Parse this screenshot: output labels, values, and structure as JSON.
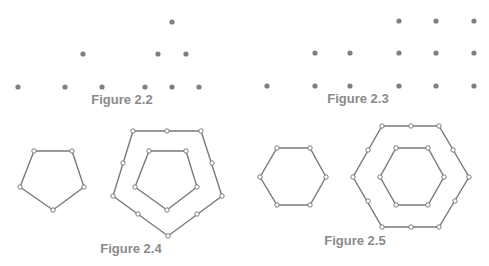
{
  "colors": {
    "dot": "#7f7f7f",
    "line": "#7a7a7a",
    "vertex_fill": "#ffffff",
    "vertex_stroke": "#6e6e6e",
    "label": "#8a8a8a"
  },
  "figures": [
    {
      "id": "fig-2-2",
      "label": "Figure 2.2",
      "label_pos": [
        122,
        93
      ],
      "description": "Triangular numbers as dot arrays: 1, 3, 6",
      "dots": [
        [
          18,
          87
        ],
        [
          83,
          54
        ],
        [
          65,
          87
        ],
        [
          102,
          87
        ],
        [
          172,
          22
        ],
        [
          158,
          54
        ],
        [
          186,
          54
        ],
        [
          145,
          87
        ],
        [
          172,
          87
        ],
        [
          199,
          87
        ]
      ]
    },
    {
      "id": "fig-2-3",
      "label": "Figure 2.3",
      "label_pos": [
        358,
        92
      ],
      "description": "Square numbers as dot arrays: 1, 4, 9",
      "dots": [
        [
          267,
          86
        ],
        [
          315,
          53
        ],
        [
          350,
          53
        ],
        [
          315,
          86
        ],
        [
          350,
          86
        ],
        [
          399,
          21
        ],
        [
          436,
          21
        ],
        [
          474,
          21
        ],
        [
          399,
          53
        ],
        [
          436,
          53
        ],
        [
          474,
          53
        ],
        [
          399,
          86
        ],
        [
          436,
          86
        ],
        [
          474,
          86
        ]
      ]
    },
    {
      "id": "fig-2-4",
      "label": "Figure 2.4",
      "label_pos": [
        131,
        242
      ],
      "description": "Pentagonal numbers: nested pentagons",
      "polygons": [
        {
          "name": "small-pentagon",
          "points": [
            [
              34,
              151
            ],
            [
              72,
              151
            ],
            [
              84,
              187
            ],
            [
              53,
              210
            ],
            [
              20,
              187
            ]
          ],
          "vertices": [
            [
              34,
              151
            ],
            [
              72,
              151
            ],
            [
              84,
              187
            ],
            [
              53,
              210
            ],
            [
              20,
              187
            ]
          ]
        },
        {
          "name": "outer-pentagon",
          "points": [
            [
              133,
              131
            ],
            [
              201,
              131
            ],
            [
              222,
              196
            ],
            [
              168,
              236
            ],
            [
              113,
              196
            ]
          ],
          "vertices": [
            [
              133,
              131
            ],
            [
              167,
              131
            ],
            [
              201,
              131
            ],
            [
              212,
              163
            ],
            [
              222,
              196
            ],
            [
              197,
              214
            ],
            [
              168,
              236
            ],
            [
              138,
              214
            ],
            [
              113,
              196
            ],
            [
              123,
              163
            ]
          ]
        },
        {
          "name": "inner-pentagon",
          "points": [
            [
              149,
              151
            ],
            [
              186,
              151
            ],
            [
              197,
              187
            ],
            [
              167,
              210
            ],
            [
              135,
              187
            ]
          ],
          "vertices": [
            [
              149,
              151
            ],
            [
              186,
              151
            ],
            [
              197,
              187
            ],
            [
              167,
              210
            ],
            [
              135,
              187
            ]
          ]
        }
      ]
    },
    {
      "id": "fig-2-5",
      "label": "Figure 2.5",
      "label_pos": [
        355,
        234
      ],
      "description": "Hexagonal numbers: nested hexagons",
      "polygons": [
        {
          "name": "small-hexagon",
          "points": [
            [
              277,
              148
            ],
            [
              310,
              148
            ],
            [
              326,
              177
            ],
            [
              310,
              205
            ],
            [
              277,
              205
            ],
            [
              260,
              177
            ]
          ],
          "vertices": [
            [
              277,
              148
            ],
            [
              310,
              148
            ],
            [
              326,
              177
            ],
            [
              310,
              205
            ],
            [
              277,
              205
            ],
            [
              260,
              177
            ]
          ]
        },
        {
          "name": "outer-hexagon",
          "points": [
            [
              382,
              126
            ],
            [
              439,
              126
            ],
            [
              469,
              177
            ],
            [
              439,
              227
            ],
            [
              382,
              227
            ],
            [
              353,
              177
            ]
          ],
          "vertices": [
            [
              382,
              126
            ],
            [
              411,
              126
            ],
            [
              439,
              126
            ],
            [
              453,
              150
            ],
            [
              469,
              177
            ],
            [
              455,
              201
            ],
            [
              439,
              227
            ],
            [
              411,
              227
            ],
            [
              382,
              227
            ],
            [
              368,
              201
            ],
            [
              353,
              177
            ],
            [
              368,
              150
            ]
          ]
        },
        {
          "name": "inner-hexagon",
          "points": [
            [
              396,
              148
            ],
            [
              428,
              148
            ],
            [
              444,
              177
            ],
            [
              428,
              205
            ],
            [
              396,
              205
            ],
            [
              380,
              177
            ]
          ],
          "vertices": [
            [
              396,
              148
            ],
            [
              428,
              148
            ],
            [
              444,
              177
            ],
            [
              428,
              205
            ],
            [
              396,
              205
            ],
            [
              380,
              177
            ]
          ]
        }
      ]
    }
  ]
}
